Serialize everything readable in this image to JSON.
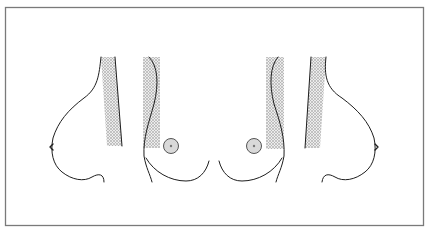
{
  "figure": {
    "title": "",
    "caption": "",
    "colors": {
      "background": "#ffffff",
      "frame": "#7a7a7a",
      "outline": "#1e1e1e",
      "hatch_light": "#e6e6e6",
      "hatch_dark": "#b0b0b0",
      "areola_fill": "#d9d9d9",
      "areola_stroke": "#555555"
    },
    "panels": [
      {
        "id": "left-profile",
        "label": "",
        "view": "lateral profile, facing left"
      },
      {
        "id": "left-frontal",
        "label": "",
        "view": "frontal, left breast"
      },
      {
        "id": "right-frontal",
        "label": "",
        "view": "frontal, right breast"
      },
      {
        "id": "right-profile",
        "label": "",
        "view": "lateral profile, facing right"
      }
    ],
    "icons": {
      "hatched-band": "cross-hatch pattern",
      "areola": "gray circle with center dot"
    }
  }
}
